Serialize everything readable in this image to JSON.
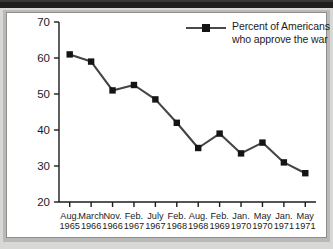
{
  "chart_data": {
    "type": "line",
    "title": "",
    "xlabel": "",
    "ylabel": "",
    "ylim": [
      20,
      70
    ],
    "ytick_values": [
      20,
      30,
      40,
      50,
      60,
      70
    ],
    "ytick_labels": [
      "20",
      "30",
      "40",
      "50",
      "60",
      "70"
    ],
    "grid": false,
    "legend_position": "top-right",
    "categories": [
      "Aug.\n1965",
      "March\n1966",
      "Nov.\n1966",
      "Feb.\n1967",
      "July\n1967",
      "Feb.\n1968",
      "Aug.\n1968",
      "Feb.\n1969",
      "Jan.\n1970",
      "May\n1970",
      "Jan.\n1971",
      "May\n1971"
    ],
    "x_tick_labels": [
      {
        "month": "Aug.",
        "year": "1965"
      },
      {
        "month": "March",
        "year": "1966"
      },
      {
        "month": "Nov.",
        "year": "1966"
      },
      {
        "month": "Feb.",
        "year": "1967"
      },
      {
        "month": "July",
        "year": "1967"
      },
      {
        "month": "Feb.",
        "year": "1968"
      },
      {
        "month": "Aug.",
        "year": "1968"
      },
      {
        "month": "Feb.",
        "year": "1969"
      },
      {
        "month": "Jan.",
        "year": "1970"
      },
      {
        "month": "May",
        "year": "1970"
      },
      {
        "month": "Jan.",
        "year": "1971"
      },
      {
        "month": "May",
        "year": "1971"
      }
    ],
    "series": [
      {
        "name": "Percent of Americans who approve the war",
        "values": [
          61,
          59,
          51,
          52.5,
          48.5,
          42,
          35,
          39,
          33.5,
          36.5,
          31,
          28
        ],
        "color": "#444444",
        "marker": "square",
        "marker_color": "#141414"
      }
    ]
  },
  "legend": {
    "line1": "Percent of Americans",
    "line2": "who approve the war",
    "marker_color": "#141414",
    "line_color": "#4a4a4a"
  },
  "colors": {
    "background": "#ffffff",
    "frame": "#b9b9b7",
    "top_band": "#211f1e",
    "axis": "#1c1c1c",
    "text": "#1c1c1c"
  }
}
